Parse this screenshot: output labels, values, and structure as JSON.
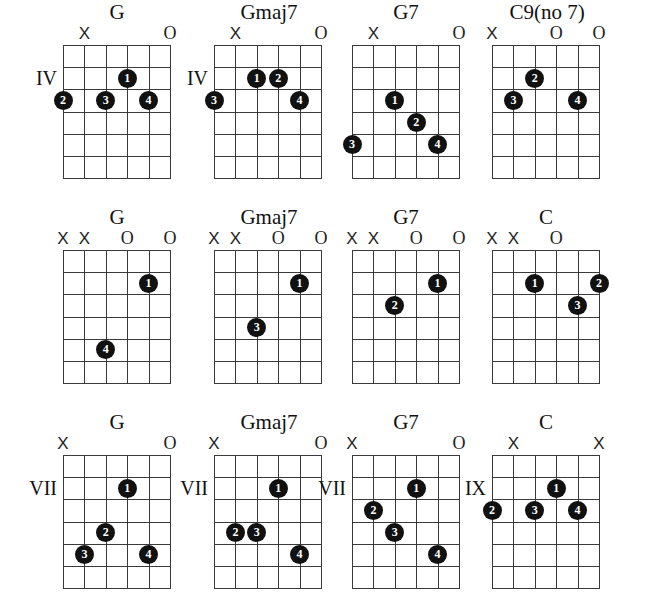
{
  "page": {
    "grid_spec": {
      "strings": 6,
      "frets": 6,
      "string_spacing_px": 21.4,
      "fret_spacing_px": 22.2
    },
    "colors": {
      "ink": "#111111",
      "grid_line": "#3a3a3a",
      "dot_fill": "#111111",
      "dot_text": "#ffffff",
      "background": "#ffffff"
    },
    "marker_glyphs": {
      "muted": "X",
      "open": "O"
    }
  },
  "rows": [
    {
      "row_index": 1,
      "chords": [
        {
          "name": "G",
          "position_label": "IV",
          "position_fret_row": 2,
          "left_px": 63,
          "wide": false,
          "markers": [
            {
              "string": 2,
              "type": "muted",
              "glyph": "X"
            },
            {
              "string": 6,
              "type": "open",
              "glyph": "O"
            }
          ],
          "dots": [
            {
              "finger": "1",
              "string": 4,
              "fret": 2
            },
            {
              "finger": "2",
              "string": 1,
              "fret": 3
            },
            {
              "finger": "3",
              "string": 3,
              "fret": 3
            },
            {
              "finger": "4",
              "string": 5,
              "fret": 3
            }
          ]
        },
        {
          "name": "Gmaj7",
          "position_label": "IV",
          "position_fret_row": 2,
          "left_px": 214,
          "wide": true,
          "markers": [
            {
              "string": 2,
              "type": "muted",
              "glyph": "X"
            },
            {
              "string": 6,
              "type": "open",
              "glyph": "O"
            }
          ],
          "dots": [
            {
              "finger": "1",
              "string": 3,
              "fret": 2
            },
            {
              "finger": "2",
              "string": 4,
              "fret": 2
            },
            {
              "finger": "3",
              "string": 1,
              "fret": 3
            },
            {
              "finger": "4",
              "string": 5,
              "fret": 3
            }
          ]
        },
        {
          "name": "G7",
          "position_label": "",
          "position_fret_row": 0,
          "left_px": 352,
          "wide": false,
          "markers": [
            {
              "string": 2,
              "type": "muted",
              "glyph": "X"
            },
            {
              "string": 6,
              "type": "open",
              "glyph": "O"
            }
          ],
          "dots": [
            {
              "finger": "1",
              "string": 3,
              "fret": 3
            },
            {
              "finger": "2",
              "string": 4,
              "fret": 4
            },
            {
              "finger": "3",
              "string": 1,
              "fret": 5
            },
            {
              "finger": "4",
              "string": 5,
              "fret": 5
            }
          ]
        },
        {
          "name": "C9(no 7)",
          "position_label": "",
          "position_fret_row": 0,
          "left_px": 492,
          "wide": true,
          "markers": [
            {
              "string": 1,
              "type": "muted",
              "glyph": "X"
            },
            {
              "string": 4,
              "type": "open",
              "glyph": "O"
            },
            {
              "string": 6,
              "type": "open",
              "glyph": "O"
            }
          ],
          "dots": [
            {
              "finger": "2",
              "string": 3,
              "fret": 2
            },
            {
              "finger": "3",
              "string": 2,
              "fret": 3
            },
            {
              "finger": "4",
              "string": 5,
              "fret": 3
            }
          ]
        }
      ]
    },
    {
      "row_index": 2,
      "chords": [
        {
          "name": "G",
          "position_label": "",
          "position_fret_row": 0,
          "left_px": 63,
          "wide": false,
          "markers": [
            {
              "string": 1,
              "type": "muted",
              "glyph": "X"
            },
            {
              "string": 2,
              "type": "muted",
              "glyph": "X"
            },
            {
              "string": 4,
              "type": "open",
              "glyph": "O"
            },
            {
              "string": 6,
              "type": "open",
              "glyph": "O"
            }
          ],
          "dots": [
            {
              "finger": "1",
              "string": 5,
              "fret": 2
            },
            {
              "finger": "4",
              "string": 3,
              "fret": 5
            }
          ]
        },
        {
          "name": "Gmaj7",
          "position_label": "",
          "position_fret_row": 0,
          "left_px": 214,
          "wide": true,
          "markers": [
            {
              "string": 1,
              "type": "muted",
              "glyph": "X"
            },
            {
              "string": 2,
              "type": "muted",
              "glyph": "X"
            },
            {
              "string": 4,
              "type": "open",
              "glyph": "O"
            },
            {
              "string": 6,
              "type": "open",
              "glyph": "O"
            }
          ],
          "dots": [
            {
              "finger": "1",
              "string": 5,
              "fret": 2
            },
            {
              "finger": "3",
              "string": 3,
              "fret": 4
            }
          ]
        },
        {
          "name": "G7",
          "position_label": "",
          "position_fret_row": 0,
          "left_px": 352,
          "wide": false,
          "markers": [
            {
              "string": 1,
              "type": "muted",
              "glyph": "X"
            },
            {
              "string": 2,
              "type": "muted",
              "glyph": "X"
            },
            {
              "string": 4,
              "type": "open",
              "glyph": "O"
            },
            {
              "string": 6,
              "type": "open",
              "glyph": "O"
            }
          ],
          "dots": [
            {
              "finger": "1",
              "string": 5,
              "fret": 2
            },
            {
              "finger": "2",
              "string": 3,
              "fret": 3
            }
          ]
        },
        {
          "name": "C",
          "position_label": "",
          "position_fret_row": 0,
          "left_px": 492,
          "wide": false,
          "markers": [
            {
              "string": 1,
              "type": "muted",
              "glyph": "X"
            },
            {
              "string": 2,
              "type": "muted",
              "glyph": "X"
            },
            {
              "string": 4,
              "type": "open",
              "glyph": "O"
            }
          ],
          "dots": [
            {
              "finger": "1",
              "string": 3,
              "fret": 2
            },
            {
              "finger": "2",
              "string": 6,
              "fret": 2
            },
            {
              "finger": "3",
              "string": 5,
              "fret": 3
            }
          ]
        }
      ]
    },
    {
      "row_index": 3,
      "chords": [
        {
          "name": "G",
          "position_label": "VII",
          "position_fret_row": 2,
          "left_px": 63,
          "wide": false,
          "markers": [
            {
              "string": 1,
              "type": "muted",
              "glyph": "X"
            },
            {
              "string": 6,
              "type": "open",
              "glyph": "O"
            }
          ],
          "dots": [
            {
              "finger": "1",
              "string": 4,
              "fret": 2
            },
            {
              "finger": "2",
              "string": 3,
              "fret": 4
            },
            {
              "finger": "3",
              "string": 2,
              "fret": 5
            },
            {
              "finger": "4",
              "string": 5,
              "fret": 5
            }
          ]
        },
        {
          "name": "Gmaj7",
          "position_label": "VII",
          "position_fret_row": 2,
          "left_px": 214,
          "wide": true,
          "markers": [
            {
              "string": 1,
              "type": "muted",
              "glyph": "X"
            },
            {
              "string": 6,
              "type": "open",
              "glyph": "O"
            }
          ],
          "dots": [
            {
              "finger": "1",
              "string": 4,
              "fret": 2
            },
            {
              "finger": "2",
              "string": 2,
              "fret": 4
            },
            {
              "finger": "3",
              "string": 3,
              "fret": 4
            },
            {
              "finger": "4",
              "string": 5,
              "fret": 5
            }
          ]
        },
        {
          "name": "G7",
          "position_label": "VII",
          "position_fret_row": 2,
          "left_px": 352,
          "wide": false,
          "markers": [
            {
              "string": 1,
              "type": "muted",
              "glyph": "X"
            },
            {
              "string": 6,
              "type": "open",
              "glyph": "O"
            }
          ],
          "dots": [
            {
              "finger": "1",
              "string": 4,
              "fret": 2
            },
            {
              "finger": "2",
              "string": 2,
              "fret": 3
            },
            {
              "finger": "3",
              "string": 3,
              "fret": 4
            },
            {
              "finger": "4",
              "string": 5,
              "fret": 5
            }
          ]
        },
        {
          "name": "C",
          "position_label": "IX",
          "position_fret_row": 2,
          "left_px": 492,
          "wide": false,
          "markers": [
            {
              "string": 2,
              "type": "muted",
              "glyph": "X"
            },
            {
              "string": 6,
              "type": "muted",
              "glyph": "X"
            }
          ],
          "dots": [
            {
              "finger": "1",
              "string": 4,
              "fret": 2
            },
            {
              "finger": "2",
              "string": 1,
              "fret": 3
            },
            {
              "finger": "3",
              "string": 3,
              "fret": 3
            },
            {
              "finger": "4",
              "string": 5,
              "fret": 3
            }
          ]
        }
      ]
    }
  ]
}
